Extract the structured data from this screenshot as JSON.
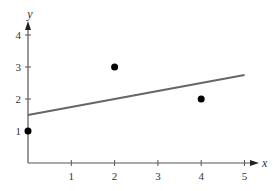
{
  "chart_data": {
    "type": "scatter",
    "title": "",
    "xlabel": "x",
    "ylabel": "y",
    "xlim": [
      0,
      5
    ],
    "ylim": [
      0,
      4
    ],
    "xticks": [
      1,
      2,
      3,
      4,
      5
    ],
    "yticks": [
      1,
      2,
      3,
      4
    ],
    "grid": false,
    "legend": null,
    "series": [
      {
        "name": "points",
        "type": "scatter",
        "x": [
          0,
          2,
          4
        ],
        "y": [
          1,
          3,
          2
        ],
        "color": "#000000"
      },
      {
        "name": "regression line",
        "type": "line",
        "x": [
          0,
          5
        ],
        "y": [
          1.5,
          2.75
        ],
        "equation": "y = 0.25x + 1.5",
        "color": "#666666"
      }
    ]
  },
  "colors": {
    "axis": "#555555",
    "line": "#666666",
    "points": "#000000",
    "text": "#333333"
  }
}
